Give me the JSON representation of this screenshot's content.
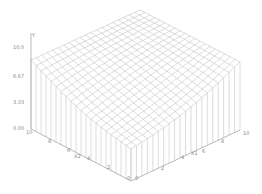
{
  "chart_data": {
    "type": "surface3d",
    "title": "",
    "x1label": "X1",
    "x2label": "X2",
    "ylabel": "Y",
    "x1_range": [
      0,
      10
    ],
    "x2_range": [
      0,
      10
    ],
    "y_range": [
      0.0,
      10.0
    ],
    "grid_steps": 20,
    "function_description": "bowl-shaped surface, minimum near (0,0), rising toward x1=10 and x2=10",
    "corner_values": {
      "x1_0_x2_0": 3.9,
      "x1_10_x2_0": 8.3,
      "x1_0_x2_10": 8.4,
      "x1_10_x2_10": 8.3
    },
    "y_ticks": [
      "0.00",
      "3.33",
      "6.67",
      "10.0"
    ],
    "x1_ticks": [
      "0",
      "2",
      "4",
      "6",
      "8",
      "10"
    ],
    "x2_ticks": [
      "0",
      "2",
      "4",
      "6",
      "8",
      "10"
    ],
    "grid": false,
    "legend": null
  },
  "colors": {
    "mesh": "#b8b8b8",
    "axis": "#8a8a8a",
    "text": "#888888",
    "background": "#ffffff"
  }
}
